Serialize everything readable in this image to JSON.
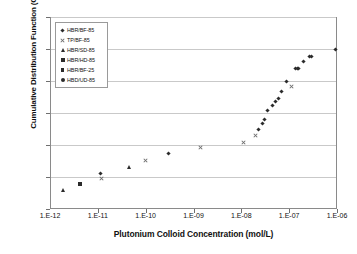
{
  "chart_data": {
    "type": "scatter",
    "title": "",
    "xlabel": "Plutonium Colloid Concentration (mol/L)",
    "ylabel": "Cumulative Distribution Function (CDF)",
    "x_scale": "log",
    "xlim": [
      1e-12,
      1e-06
    ],
    "ylim": [
      0,
      1.2
    ],
    "grid": "horizontal",
    "legend_position": "upper-left",
    "y_ticks": [
      "0",
      "0.2",
      "0.4",
      "0.6",
      "0.8",
      "1",
      "1.2"
    ],
    "y_tick_values": [
      0,
      0.2,
      0.4,
      0.6,
      0.8,
      1,
      1.2
    ],
    "x_ticks": [
      "1.E-12",
      "1.E-11",
      "1.E-10",
      "1.E-09",
      "1.E-08",
      "1.E-07",
      "1.E-06"
    ],
    "x_tick_values": [
      1e-12,
      1e-11,
      1e-10,
      1e-09,
      1e-08,
      1e-07,
      1e-06
    ],
    "series": [
      {
        "name": "HBR/BF-85",
        "marker": "diamond",
        "color": "#2b2b2b",
        "points": [
          {
            "x": 1.15e-11,
            "y": 0.225
          },
          {
            "x": 3e-10,
            "y": 0.345
          },
          {
            "x": 2.3e-08,
            "y": 0.5
          },
          {
            "x": 2.8e-08,
            "y": 0.535
          },
          {
            "x": 3.1e-08,
            "y": 0.558
          },
          {
            "x": 3.6e-08,
            "y": 0.613
          },
          {
            "x": 4.4e-08,
            "y": 0.645
          },
          {
            "x": 5.2e-08,
            "y": 0.672
          },
          {
            "x": 6e-08,
            "y": 0.69
          },
          {
            "x": 7e-08,
            "y": 0.733
          },
          {
            "x": 8.6e-08,
            "y": 0.8
          },
          {
            "x": 1.35e-07,
            "y": 0.877
          },
          {
            "x": 1.5e-07,
            "y": 0.877
          },
          {
            "x": 1.6e-07,
            "y": 0.877
          },
          {
            "x": 2e-07,
            "y": 0.92
          },
          {
            "x": 2.6e-07,
            "y": 0.955
          },
          {
            "x": 3e-07,
            "y": 0.955
          },
          {
            "x": 9.5e-07,
            "y": 0.995
          }
        ]
      },
      {
        "name": "TP/BF-85",
        "marker": "cross",
        "color": "#6e6e6e",
        "points": [
          {
            "x": 1.2e-11,
            "y": 0.19
          },
          {
            "x": 1e-10,
            "y": 0.305
          },
          {
            "x": 1.4e-09,
            "y": 0.385
          },
          {
            "x": 1.1e-08,
            "y": 0.418
          },
          {
            "x": 2e-08,
            "y": 0.458
          },
          {
            "x": 1.1e-07,
            "y": 0.765
          }
        ]
      },
      {
        "name": "HBR/SD-85",
        "marker": "triangle",
        "color": "#2b2b2b",
        "points": [
          {
            "x": 1.9e-12,
            "y": 0.115
          },
          {
            "x": 4.6e-11,
            "y": 0.263
          }
        ]
      },
      {
        "name": "HBR/HD-85",
        "marker": "square",
        "color": "#2b2b2b",
        "points": [
          {
            "x": 4.3e-12,
            "y": 0.155
          }
        ]
      },
      {
        "name": "HBR/BF-25",
        "marker": "square-small",
        "color": "#2b2b2b",
        "points": []
      },
      {
        "name": "HBD/UD-85",
        "marker": "circle",
        "color": "#2b2b2b",
        "points": []
      }
    ]
  },
  "legend": {
    "items": [
      {
        "label": "HBR/BF-85",
        "marker": "diamond"
      },
      {
        "label": "TP/BF-85",
        "marker": "cross"
      },
      {
        "label": "HBR/SD-85",
        "marker": "triangle"
      },
      {
        "label": "HBR/HD-85",
        "marker": "square"
      },
      {
        "label": "HBR/BF-25",
        "marker": "square-small"
      },
      {
        "label": "HBD/UD-85",
        "marker": "circle"
      }
    ]
  }
}
